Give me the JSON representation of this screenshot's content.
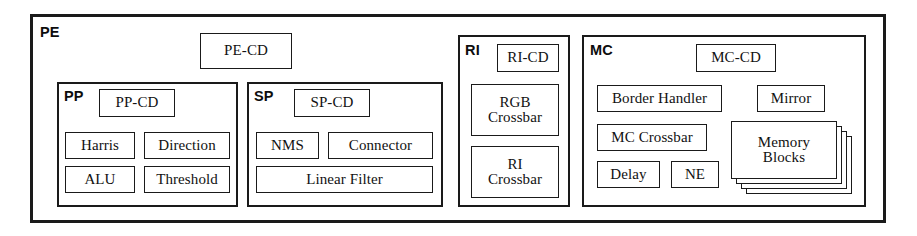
{
  "figure": {
    "type": "block-diagram",
    "background_color": "#ffffff",
    "line_color": "#1a1a1a"
  },
  "pe": {
    "tag": "PE",
    "cd": {
      "label": "PE-CD"
    },
    "pp": {
      "tag": "PP",
      "cd": {
        "label": "PP-CD"
      },
      "units": [
        {
          "label": "Harris"
        },
        {
          "label": "Direction"
        },
        {
          "label": "ALU"
        },
        {
          "label": "Threshold"
        }
      ]
    },
    "sp": {
      "tag": "SP",
      "cd": {
        "label": "SP-CD"
      },
      "units": [
        {
          "label": "NMS"
        },
        {
          "label": "Connector"
        },
        {
          "label": "Linear Filter"
        }
      ]
    },
    "ri": {
      "tag": "RI",
      "cd": {
        "label": "RI-CD"
      },
      "units": [
        {
          "label": "RGB\nCrossbar"
        },
        {
          "label": "RI\nCrossbar"
        }
      ]
    },
    "mc": {
      "tag": "MC",
      "cd": {
        "label": "MC-CD"
      },
      "units": [
        {
          "label": "Border Handler"
        },
        {
          "label": "Mirror"
        },
        {
          "label": "MC Crossbar"
        },
        {
          "label": "Delay"
        },
        {
          "label": "NE"
        }
      ],
      "memory_stack": {
        "label": "Memory\nBlocks",
        "card_count": 4
      }
    }
  }
}
